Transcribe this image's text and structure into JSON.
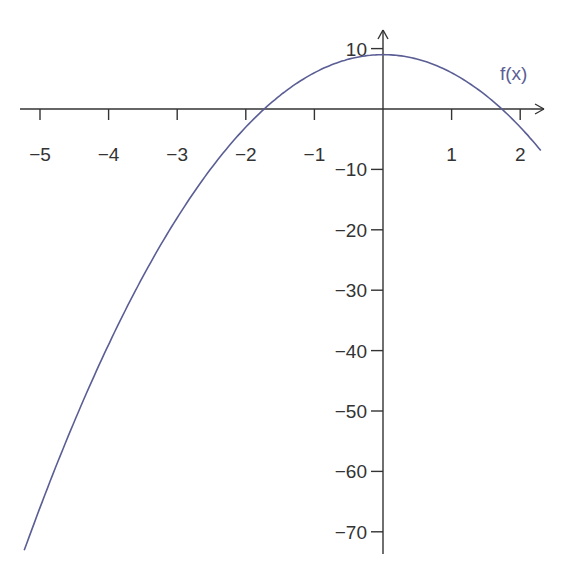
{
  "chart_data": {
    "type": "line",
    "title": "",
    "xlabel": "",
    "ylabel": "",
    "function_label": "f(x)",
    "function_expression": "f(x) = 9 - 3x^2",
    "xlim": [
      -5.3,
      2.3
    ],
    "ylim": [
      -73,
      12
    ],
    "x_ticks": [
      -5,
      -4,
      -3,
      -2,
      -1,
      1,
      2
    ],
    "x_tick_labels": [
      "−5",
      "−4",
      "−3",
      "−2",
      "−1",
      "1",
      "2"
    ],
    "y_ticks": [
      10,
      -10,
      -20,
      -30,
      -40,
      -50,
      -60,
      -70
    ],
    "y_tick_labels": [
      "10",
      "−10",
      "−20",
      "−30",
      "−40",
      "−50",
      "−60",
      "−70"
    ],
    "grid": false,
    "series": [
      {
        "name": "f(x)",
        "color": "#5a5e95",
        "x": [
          -5.23,
          -5,
          -4.5,
          -4,
          -3.5,
          -3,
          -2.5,
          -2,
          -1.73,
          -1.5,
          -1,
          -0.5,
          0,
          0.5,
          1,
          1.5,
          1.73,
          2,
          2.3
        ],
        "y": [
          -73.1,
          -66,
          -51.75,
          -39,
          -27.75,
          -18,
          -9.75,
          -3,
          0,
          2.25,
          6,
          8.25,
          9,
          8.25,
          6,
          2.25,
          0,
          -3,
          -6.87
        ]
      }
    ],
    "colors": {
      "axis": "#333333",
      "curve": "#5a5e95",
      "label": "#5a5e95"
    }
  }
}
